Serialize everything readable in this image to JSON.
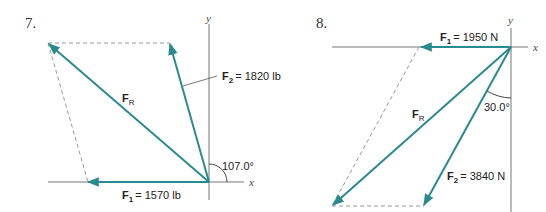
{
  "problems": [
    {
      "number": "7.",
      "axes": {
        "x_label": "x",
        "y_label": "y"
      },
      "forces": [
        {
          "name": "F",
          "subscript": "1",
          "value": "= 1570 lb"
        },
        {
          "name": "F",
          "subscript": "2",
          "value": "= 1820 lb"
        },
        {
          "name": "F",
          "subscript": "R",
          "value": ""
        }
      ],
      "angle_label": "107.0°"
    },
    {
      "number": "8.",
      "axes": {
        "x_label": "x",
        "y_label": "y"
      },
      "forces": [
        {
          "name": "F",
          "subscript": "1",
          "value": "= 1950 N"
        },
        {
          "name": "F",
          "subscript": "2",
          "value": "= 3840 N"
        },
        {
          "name": "F",
          "subscript": "R",
          "value": ""
        }
      ],
      "angle_label": "30.0°"
    }
  ],
  "colors": {
    "vector": "#2a8a8e",
    "axis": "#777777",
    "dashed": "#999999"
  }
}
